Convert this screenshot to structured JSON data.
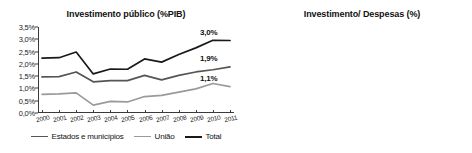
{
  "chart_data": [
    {
      "type": "line",
      "title": "Investimento público  (%PIB)",
      "xlabel": "",
      "ylabel": "",
      "ylim": [
        0,
        3.5
      ],
      "ytick_labels": [
        "0,0%",
        "0,5%",
        "1,0%",
        "1,5%",
        "2,0%",
        "2,5%",
        "3,0%",
        "3,5%"
      ],
      "ytick_values": [
        0,
        0.5,
        1.0,
        1.5,
        2.0,
        2.5,
        3.0,
        3.5
      ],
      "grid": false,
      "legend_position": "bottom",
      "categories": [
        "2000",
        "2001",
        "2002",
        "2003",
        "2004",
        "2005",
        "2006",
        "2007",
        "2008",
        "2009",
        "2010",
        "2011"
      ],
      "series": [
        {
          "name": "Estados e municípios",
          "color": "#555555",
          "values": [
            1.47,
            1.48,
            1.67,
            1.27,
            1.32,
            1.32,
            1.53,
            1.35,
            1.53,
            1.67,
            1.76,
            1.88
          ],
          "end_label": "1,9%"
        },
        {
          "name": "União",
          "color": "#9a9a9a",
          "values": [
            0.76,
            0.78,
            0.82,
            0.32,
            0.47,
            0.45,
            0.67,
            0.72,
            0.85,
            0.98,
            1.2,
            1.07
          ],
          "end_label": "1,1%"
        },
        {
          "name": "Total",
          "color": "#1a1a1a",
          "values": [
            2.23,
            2.25,
            2.48,
            1.59,
            1.79,
            1.78,
            2.2,
            2.07,
            2.38,
            2.65,
            2.96,
            2.95
          ],
          "end_label": "3,0%"
        }
      ]
    },
    {
      "type": "line",
      "title": "Investimento/ Despesas  (%)",
      "xlabel": "",
      "ylabel": "",
      "ylim": [
        0,
        8
      ],
      "ytick_labels": [
        "0,0",
        "1,0",
        "2,0",
        "3,0",
        "4,0",
        "5,0",
        "6,0",
        "7,0",
        "8,0"
      ],
      "ytick_values": [
        0,
        1,
        2,
        3,
        4,
        5,
        6,
        7,
        8
      ],
      "grid": false,
      "legend_position": "none",
      "categories": [
        "2002",
        "2003",
        "2004",
        "2005",
        "2006",
        "2007",
        "2008",
        "2009",
        "2010",
        "2011",
        "2012"
      ],
      "series": [
        {
          "name": "Investimento/ Despesas",
          "color": "#3a3a3a",
          "values": [
            5.1,
            2.0,
            3.2,
            3.0,
            3.6,
            4.15,
            5.45,
            5.55,
            6.8,
            5.6,
            5.5
          ]
        }
      ]
    }
  ],
  "legend": {
    "items": [
      {
        "label": "Estados e municípios",
        "color": "#555555"
      },
      {
        "label": "União",
        "color": "#9a9a9a"
      },
      {
        "label": "Total",
        "color": "#1a1a1a"
      }
    ]
  }
}
